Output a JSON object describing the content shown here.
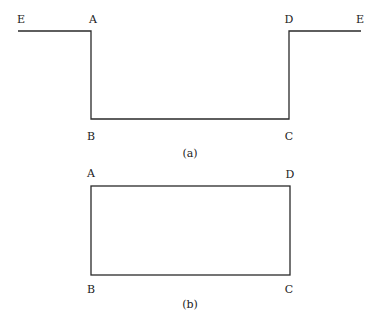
{
  "figure_a": {
    "caption": "(a)",
    "labels": {
      "E_left": "E",
      "A": "A",
      "D": "D",
      "E_right": "E",
      "B": "B",
      "C": "C"
    }
  },
  "figure_b": {
    "caption": "(b)",
    "labels": {
      "A": "A",
      "D": "D",
      "B": "B",
      "C": "C"
    }
  },
  "colors": {
    "line": "#2a2a2a",
    "background": "#ffffff"
  }
}
